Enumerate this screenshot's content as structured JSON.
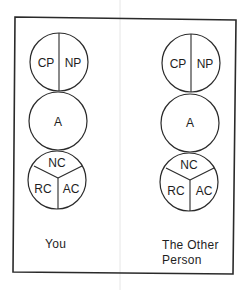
{
  "figure": {
    "columns": [
      {
        "caption_lines": [
          "You"
        ],
        "top_circle": {
          "left": "CP",
          "right": "NP"
        },
        "middle_circle": {
          "label": "A"
        },
        "bottom_circle": {
          "top": "NC",
          "left": "RC",
          "right": "AC"
        }
      },
      {
        "caption_lines": [
          "The Other",
          "Person"
        ],
        "top_circle": {
          "left": "CP",
          "right": "NP"
        },
        "middle_circle": {
          "label": "A"
        },
        "bottom_circle": {
          "top": "NC",
          "left": "RC",
          "right": "AC"
        }
      }
    ]
  },
  "colors": {
    "stroke": "#2a2a2a",
    "text": "#1e1e1e",
    "background": "#ffffff"
  }
}
